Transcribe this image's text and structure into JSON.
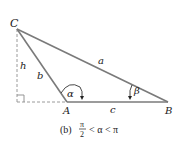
{
  "diagram": {
    "type": "triangle",
    "colors": {
      "line": "#7a7a7a",
      "dashed": "#9a9a9a",
      "text": "#222222",
      "arrow": "#222222"
    },
    "vertices": {
      "C": {
        "label": "C"
      },
      "A": {
        "label": "A"
      },
      "B": {
        "label": "B"
      }
    },
    "sides": {
      "a": "a",
      "b": "b",
      "c": "c",
      "h": "h"
    },
    "angles": {
      "alpha": "α",
      "beta": "β"
    },
    "caption": {
      "prefix": "(b)",
      "frac_num": "π",
      "frac_den": "2",
      "rest": "< α < π"
    }
  }
}
